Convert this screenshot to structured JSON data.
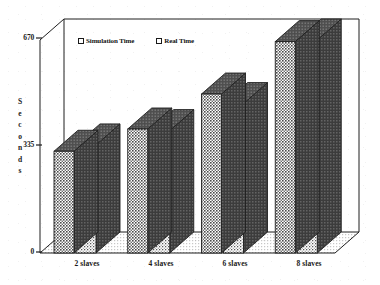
{
  "chart_data": {
    "type": "bar",
    "title": "",
    "subtitle": "",
    "xlabel": "",
    "ylabel": "Seconds",
    "ylim": [
      0,
      670
    ],
    "yticks": [
      "0",
      "335",
      "670"
    ],
    "ytick_values": [
      0,
      335,
      670
    ],
    "grid": false,
    "legend_position": "top-left-inside",
    "three_d": true,
    "categories": [
      "2 slaves",
      "4 slaves",
      "6 slaves",
      "8 slaves"
    ],
    "series": [
      {
        "name": "Simulation Time",
        "values": [
          320,
          390,
          500,
          665
        ],
        "color": "#8f8f8f",
        "side_color": "#5e5e5e",
        "top_color": "#6e6e6e"
      },
      {
        "name": "Real Time",
        "values": [
          340,
          385,
          470,
          670
        ],
        "color": "#b4b4b4",
        "side_color": "#525252",
        "top_color": "#636363"
      }
    ]
  },
  "axes": {
    "y_title_letters": [
      "S",
      "e",
      "c",
      "o",
      "n",
      "d",
      "s"
    ],
    "y_tick_top": "670",
    "y_tick_mid": "335",
    "y_tick_bottom": "0"
  },
  "legend": {
    "items": [
      {
        "label": "Simulation Time",
        "marker": "open-square-marker"
      },
      {
        "label": "Real Time",
        "marker": "open-square-marker"
      }
    ]
  },
  "xaxis": {
    "labels": [
      "2 slaves",
      "4 slaves",
      "6 slaves",
      "8 slaves"
    ]
  },
  "style": {
    "frame_color": "#1f1f1f",
    "background": "#ffffff",
    "floor_color": "#d2d2d2",
    "text_color": "#1a1a1a"
  }
}
